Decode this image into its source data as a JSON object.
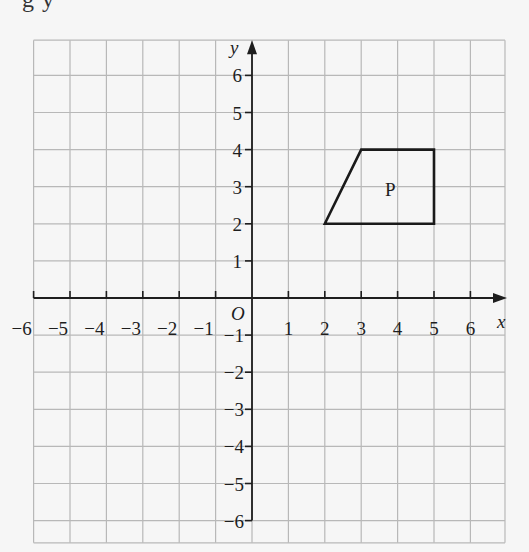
{
  "top_fragment_text": "g y",
  "diagram": {
    "type": "coordinate-grid",
    "x_axis": {
      "label": "x",
      "range": [
        -6,
        6
      ],
      "tick_labels": [
        "−6",
        "−5",
        "−4",
        "−3",
        "−2",
        "−1",
        "1",
        "2",
        "3",
        "4",
        "5",
        "6"
      ]
    },
    "y_axis": {
      "label": "y",
      "range": [
        -6,
        6
      ],
      "tick_labels_positive": [
        "1",
        "2",
        "3",
        "4",
        "5",
        "6"
      ],
      "tick_labels_negative": [
        "−1",
        "−2",
        "−3",
        "−4",
        "−5",
        "−6"
      ]
    },
    "origin_label": "O",
    "shapes": [
      {
        "name": "P",
        "label": "P",
        "vertices": [
          [
            2,
            2
          ],
          [
            3,
            4
          ],
          [
            5,
            4
          ],
          [
            5,
            2
          ]
        ],
        "label_position": [
          3.8,
          2.9
        ]
      }
    ],
    "grid": true,
    "colors": {
      "grid_line": "#b8b8b8",
      "axis": "#1e1e1e",
      "shape_stroke": "#1a1a1a",
      "background": "#f6f6f6"
    }
  }
}
